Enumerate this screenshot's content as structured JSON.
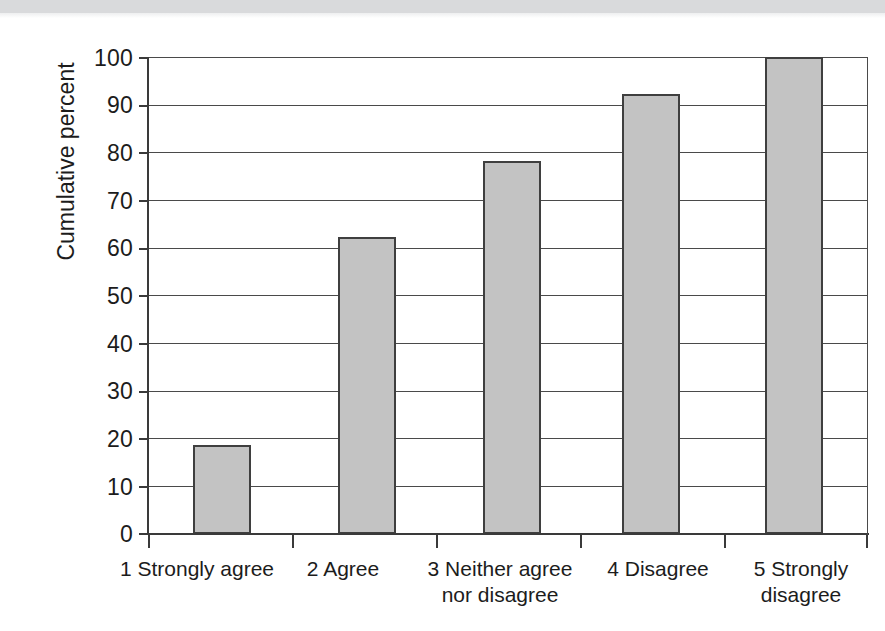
{
  "chart_data": {
    "type": "bar",
    "title": "",
    "subtitle": "",
    "xlabel": "",
    "ylabel": "Cumulative percent",
    "ylim": [
      0,
      100
    ],
    "ytick_step": 10,
    "yticks": [
      "100",
      "90",
      "80",
      "70",
      "60",
      "50",
      "40",
      "30",
      "20",
      "10",
      "0"
    ],
    "grid": "horizontal",
    "legend": "none",
    "bar_fill_color": "#c3c3c3",
    "bar_edge_color": "#3f3f3f",
    "axis_color": "#3a3a3a",
    "categories": [
      "1 Strongly agree",
      "2 Agree",
      "3 Neither agree nor disagree",
      "4 Disagree",
      "5 Strongly disagree"
    ],
    "category_label_lines": [
      [
        "1 Strongly agree"
      ],
      [
        "2 Agree"
      ],
      [
        "3 Neither agree",
        "nor disagree"
      ],
      [
        "4 Disagree"
      ],
      [
        "5 Strongly",
        "disagree"
      ]
    ],
    "values": [
      18.7,
      62.3,
      78.3,
      92.2,
      100
    ]
  }
}
